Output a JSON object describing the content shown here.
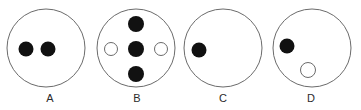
{
  "figure": {
    "title": "",
    "width": 361,
    "height": 110,
    "background_color": "#ffffff"
  },
  "style": {
    "outline_circle_stroke": "#6b6b6b",
    "outline_circle_fill": "#ffffff",
    "outline_circle_stroke_width": 1,
    "filled_dot_color": "#111111",
    "hollow_dot_fill": "#ffffff",
    "hollow_dot_stroke": "#6b6b6b",
    "hollow_dot_stroke_width": 1,
    "label_color": "#2b2b2b"
  },
  "panels": [
    {
      "label": "A",
      "label_x": 50,
      "label_y": 93,
      "circle": {
        "cx": 46,
        "cy": 48,
        "r": 39
      },
      "dot_count": 2,
      "filled_count": 2,
      "hollow_count": 0,
      "dots": [
        {
          "name": "dot-a-1",
          "type": "filled",
          "cx": 26,
          "cy": 49,
          "r": 7.5
        },
        {
          "name": "dot-a-2",
          "type": "filled",
          "cx": 48,
          "cy": 49,
          "r": 7.5
        }
      ]
    },
    {
      "label": "B",
      "label_x": 137,
      "label_y": 93,
      "circle": {
        "cx": 136,
        "cy": 48,
        "r": 39
      },
      "dot_count": 5,
      "filled_count": 3,
      "hollow_count": 2,
      "dots": [
        {
          "name": "dot-b-top",
          "type": "filled",
          "cx": 136,
          "cy": 24,
          "r": 8
        },
        {
          "name": "dot-b-left",
          "type": "hollow",
          "cx": 111,
          "cy": 49,
          "r": 6.5
        },
        {
          "name": "dot-b-center",
          "type": "filled",
          "cx": 136,
          "cy": 49,
          "r": 8
        },
        {
          "name": "dot-b-right",
          "type": "hollow",
          "cx": 161,
          "cy": 49,
          "r": 6.5
        },
        {
          "name": "dot-b-bottom",
          "type": "filled",
          "cx": 136,
          "cy": 74,
          "r": 8
        }
      ]
    },
    {
      "label": "C",
      "label_x": 223,
      "label_y": 93,
      "circle": {
        "cx": 223,
        "cy": 48,
        "r": 39
      },
      "dot_count": 1,
      "filled_count": 1,
      "hollow_count": 0,
      "dots": [
        {
          "name": "dot-c-1",
          "type": "filled",
          "cx": 199,
          "cy": 50,
          "r": 7.5
        }
      ]
    },
    {
      "label": "D",
      "label_x": 311,
      "label_y": 93,
      "circle": {
        "cx": 312,
        "cy": 48,
        "r": 39
      },
      "dot_count": 2,
      "filled_count": 1,
      "hollow_count": 1,
      "dots": [
        {
          "name": "dot-d-filled",
          "type": "filled",
          "cx": 287,
          "cy": 46,
          "r": 7.5
        },
        {
          "name": "dot-d-hollow",
          "type": "hollow",
          "cx": 308,
          "cy": 70,
          "r": 7.5
        }
      ]
    }
  ]
}
